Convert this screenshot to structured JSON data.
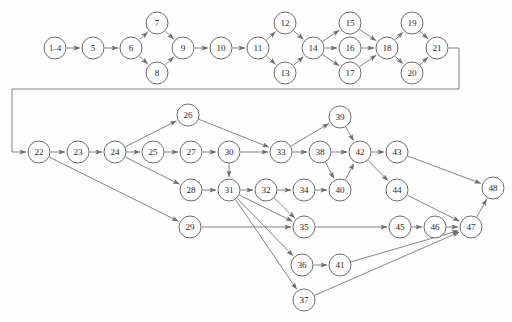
{
  "figure": {
    "type": "directed-graph",
    "title": "",
    "caption": "",
    "background_color": "#fefefe",
    "node_fill": "#ffffff",
    "node_stroke": "#5b5b5b",
    "edge_color": "#6e6e6e",
    "label_color": "#2a2a2a"
  },
  "graph_data": {
    "type": "diagram",
    "layout": "two-row-flow",
    "node_radius": 11,
    "nodes": [
      {
        "id": "1-4",
        "label": "1–4",
        "x": 55,
        "y": 48,
        "wide": true
      },
      {
        "id": "5",
        "label": "5",
        "x": 93,
        "y": 48
      },
      {
        "id": "6",
        "label": "6",
        "x": 131,
        "y": 48
      },
      {
        "id": "7",
        "label": "7",
        "x": 157,
        "y": 23
      },
      {
        "id": "8",
        "label": "8",
        "x": 157,
        "y": 73
      },
      {
        "id": "9",
        "label": "9",
        "x": 183,
        "y": 48
      },
      {
        "id": "10",
        "label": "10",
        "x": 221,
        "y": 48
      },
      {
        "id": "11",
        "label": "11",
        "x": 258,
        "y": 48
      },
      {
        "id": "12",
        "label": "12",
        "x": 285,
        "y": 23
      },
      {
        "id": "13",
        "label": "13",
        "x": 285,
        "y": 73
      },
      {
        "id": "14",
        "label": "14",
        "x": 313,
        "y": 48
      },
      {
        "id": "15",
        "label": "15",
        "x": 350,
        "y": 23
      },
      {
        "id": "16",
        "label": "16",
        "x": 350,
        "y": 48
      },
      {
        "id": "17",
        "label": "17",
        "x": 350,
        "y": 73
      },
      {
        "id": "18",
        "label": "18",
        "x": 387,
        "y": 48
      },
      {
        "id": "19",
        "label": "19",
        "x": 412,
        "y": 23
      },
      {
        "id": "20",
        "label": "20",
        "x": 412,
        "y": 73
      },
      {
        "id": "21",
        "label": "21",
        "x": 437,
        "y": 48
      },
      {
        "id": "22",
        "label": "22",
        "x": 39,
        "y": 152
      },
      {
        "id": "23",
        "label": "23",
        "x": 78,
        "y": 152
      },
      {
        "id": "24",
        "label": "24",
        "x": 115,
        "y": 152
      },
      {
        "id": "25",
        "label": "25",
        "x": 153,
        "y": 152
      },
      {
        "id": "26",
        "label": "26",
        "x": 188,
        "y": 115
      },
      {
        "id": "27",
        "label": "27",
        "x": 191,
        "y": 152
      },
      {
        "id": "28",
        "label": "28",
        "x": 191,
        "y": 190
      },
      {
        "id": "29",
        "label": "29",
        "x": 190,
        "y": 227
      },
      {
        "id": "30",
        "label": "30",
        "x": 229,
        "y": 152
      },
      {
        "id": "31",
        "label": "31",
        "x": 229,
        "y": 190
      },
      {
        "id": "32",
        "label": "32",
        "x": 266,
        "y": 190
      },
      {
        "id": "33",
        "label": "33",
        "x": 281,
        "y": 152
      },
      {
        "id": "34",
        "label": "34",
        "x": 304,
        "y": 190
      },
      {
        "id": "35",
        "label": "35",
        "x": 304,
        "y": 227
      },
      {
        "id": "36",
        "label": "36",
        "x": 302,
        "y": 265
      },
      {
        "id": "37",
        "label": "37",
        "x": 304,
        "y": 300
      },
      {
        "id": "38",
        "label": "38",
        "x": 320,
        "y": 152
      },
      {
        "id": "39",
        "label": "39",
        "x": 340,
        "y": 117
      },
      {
        "id": "40",
        "label": "40",
        "x": 340,
        "y": 190
      },
      {
        "id": "41",
        "label": "41",
        "x": 340,
        "y": 265
      },
      {
        "id": "42",
        "label": "42",
        "x": 360,
        "y": 152
      },
      {
        "id": "43",
        "label": "43",
        "x": 397,
        "y": 152
      },
      {
        "id": "44",
        "label": "44",
        "x": 397,
        "y": 190
      },
      {
        "id": "45",
        "label": "45",
        "x": 400,
        "y": 227
      },
      {
        "id": "46",
        "label": "46",
        "x": 435,
        "y": 227
      },
      {
        "id": "47",
        "label": "47",
        "x": 471,
        "y": 227
      },
      {
        "id": "48",
        "label": "48",
        "x": 493,
        "y": 188
      }
    ],
    "edges": [
      [
        "1-4",
        "5"
      ],
      [
        "5",
        "6"
      ],
      [
        "6",
        "7"
      ],
      [
        "6",
        "8"
      ],
      [
        "7",
        "9"
      ],
      [
        "8",
        "9"
      ],
      [
        "9",
        "10"
      ],
      [
        "10",
        "11"
      ],
      [
        "11",
        "12"
      ],
      [
        "11",
        "13"
      ],
      [
        "12",
        "14"
      ],
      [
        "13",
        "14"
      ],
      [
        "14",
        "15"
      ],
      [
        "14",
        "16"
      ],
      [
        "14",
        "17"
      ],
      [
        "15",
        "18"
      ],
      [
        "16",
        "18"
      ],
      [
        "17",
        "18"
      ],
      [
        "18",
        "19"
      ],
      [
        "18",
        "20"
      ],
      [
        "19",
        "21"
      ],
      [
        "20",
        "21"
      ],
      [
        "22",
        "23"
      ],
      [
        "23",
        "24"
      ],
      [
        "24",
        "25"
      ],
      [
        "24",
        "26"
      ],
      [
        "24",
        "28"
      ],
      [
        "25",
        "27"
      ],
      [
        "26",
        "33"
      ],
      [
        "27",
        "30"
      ],
      [
        "28",
        "31"
      ],
      [
        "22",
        "29"
      ],
      [
        "30",
        "33"
      ],
      [
        "30",
        "31"
      ],
      [
        "31",
        "32"
      ],
      [
        "31",
        "35"
      ],
      [
        "31",
        "36"
      ],
      [
        "31",
        "37"
      ],
      [
        "32",
        "34"
      ],
      [
        "32",
        "35"
      ],
      [
        "33",
        "38"
      ],
      [
        "33",
        "39"
      ],
      [
        "34",
        "40"
      ],
      [
        "38",
        "42"
      ],
      [
        "38",
        "40"
      ],
      [
        "39",
        "42"
      ],
      [
        "40",
        "42"
      ],
      [
        "42",
        "43"
      ],
      [
        "42",
        "44"
      ],
      [
        "43",
        "48"
      ],
      [
        "44",
        "47"
      ],
      [
        "29",
        "35"
      ],
      [
        "35",
        "45"
      ],
      [
        "45",
        "46"
      ],
      [
        "46",
        "47"
      ],
      [
        "36",
        "41"
      ],
      [
        "41",
        "47"
      ],
      [
        "37",
        "47"
      ],
      [
        "47",
        "48"
      ]
    ],
    "feedback_edge": {
      "from": "21",
      "to": "22",
      "path": "right-down-left-down-right",
      "waypoints": [
        [
          459,
          48
        ],
        [
          459,
          89
        ],
        [
          12,
          89
        ],
        [
          12,
          152
        ],
        [
          39,
          152
        ]
      ]
    }
  }
}
